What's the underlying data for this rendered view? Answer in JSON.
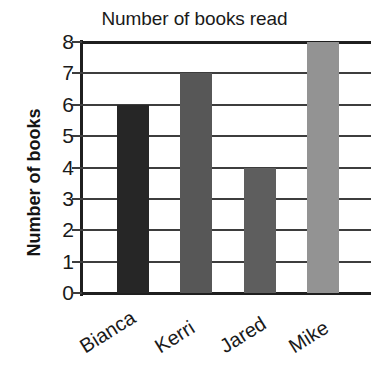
{
  "chart_data": {
    "type": "bar",
    "title": "Number of books read",
    "xlabel": "",
    "ylabel": "Number of books",
    "categories": [
      "Bianca",
      "Kerri",
      "Jared",
      "Mike"
    ],
    "values": [
      6,
      7,
      4,
      8
    ],
    "ylim": [
      0,
      8
    ],
    "ytick_labels": [
      "8",
      "7",
      "6",
      "5",
      "4",
      "3",
      "2",
      "1",
      "0"
    ],
    "ytick_values": [
      8,
      7,
      6,
      5,
      4,
      3,
      2,
      1,
      0
    ],
    "grid": true,
    "legend": false,
    "bar_colors": [
      "#262626",
      "#575757",
      "#5e5e5e",
      "#939393"
    ],
    "axis_color": "#1f1f1f",
    "grid_color": "#3d3d3d",
    "background": "#ffffff"
  }
}
